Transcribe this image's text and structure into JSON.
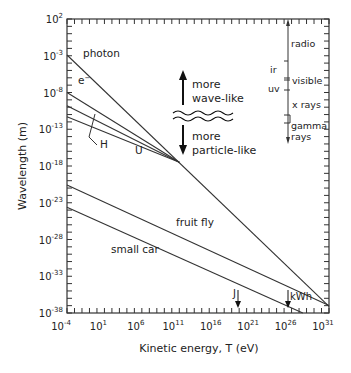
{
  "chart_data": {
    "type": "line",
    "title": "",
    "xlabel": "Kinetic energy, T (eV)",
    "ylabel": "Wavelength (m)",
    "xscale": "log",
    "yscale": "log",
    "xlim_exp": [
      -4,
      31
    ],
    "ylim_exp": [
      -38,
      2
    ],
    "x_ticks": [
      {
        "base": "10",
        "exp": "-4",
        "value": -4
      },
      {
        "base": "10",
        "exp": "1",
        "value": 1
      },
      {
        "base": "10",
        "exp": "6",
        "value": 6
      },
      {
        "base": "10",
        "exp": "11",
        "value": 11
      },
      {
        "base": "10",
        "exp": "16",
        "value": 16
      },
      {
        "base": "10",
        "exp": "21",
        "value": 21
      },
      {
        "base": "10",
        "exp": "26",
        "value": 26
      },
      {
        "base": "10",
        "exp": "31",
        "value": 31
      }
    ],
    "y_ticks": [
      {
        "base": "10",
        "exp": "2",
        "value": 2
      },
      {
        "base": "10",
        "exp": "-3",
        "value": -3
      },
      {
        "base": "10",
        "exp": "-8",
        "value": -8
      },
      {
        "base": "10",
        "exp": "-13",
        "value": -13
      },
      {
        "base": "10",
        "exp": "-18",
        "value": -18
      },
      {
        "base": "10",
        "exp": "-23",
        "value": -23
      },
      {
        "base": "10",
        "exp": "-28",
        "value": -28
      },
      {
        "base": "10",
        "exp": "-33",
        "value": -33
      },
      {
        "base": "10",
        "exp": "-38",
        "value": -38
      }
    ],
    "grid": false,
    "series": [
      {
        "name": "photon",
        "points_log10": [
          [
            -4,
            -2.9
          ],
          [
            31,
            -37.1
          ]
        ]
      },
      {
        "name": "e-",
        "points_log10": [
          [
            -4,
            -8.0
          ],
          [
            11,
            -17.5
          ]
        ]
      },
      {
        "name": "H",
        "points_log10": [
          [
            -4,
            -9.8
          ],
          [
            11,
            -17.5
          ]
        ]
      },
      {
        "name": "U",
        "points_log10": [
          [
            -4,
            -11.3
          ],
          [
            11,
            -17.5
          ]
        ]
      },
      {
        "name": "fruit fly",
        "points_log10": [
          [
            -4,
            -20.6
          ],
          [
            31,
            -37.0
          ]
        ]
      },
      {
        "name": "small car",
        "points_log10": [
          [
            -4,
            -23.6
          ],
          [
            27.5,
            -38.0
          ]
        ]
      }
    ],
    "annotations": [
      {
        "text": "photon"
      },
      {
        "text": "e⁻"
      },
      {
        "text": "H"
      },
      {
        "text": "U"
      },
      {
        "text": "fruit fly"
      },
      {
        "text": "small car"
      },
      {
        "text": "more wave-like",
        "arrow": "up"
      },
      {
        "text": "more particle-like",
        "arrow": "down"
      },
      {
        "text": "J",
        "x_log10": 18.8,
        "arrow": "down"
      },
      {
        "text": "kWh",
        "x_log10": 25.6,
        "arrow": "down"
      }
    ],
    "spectrum_bands": [
      "radio",
      "ir",
      "visible",
      "uv",
      "x rays",
      "gamma rays"
    ]
  },
  "labels": {
    "photon": "photon",
    "electron": "e",
    "electron_sup": "−",
    "hydrogen": "H",
    "uranium": "U",
    "fruit_fly": "fruit fly",
    "small_car": "small car",
    "wave_more": "more",
    "wave_like": "wave-like",
    "particle_more": "more",
    "particle_like": "particle-like",
    "joule": "J",
    "kwh": "kWh",
    "radio": "radio",
    "ir": "ir",
    "visible": "visible",
    "uv": "uv",
    "xrays": "x rays",
    "gamma1": "gamma",
    "gamma2": "rays",
    "xlabel": "Kinetic energy, T (eV)",
    "ylabel": "Wavelength (m)"
  }
}
